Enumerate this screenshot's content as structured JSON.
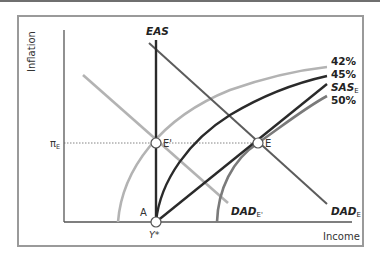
{
  "diagram": {
    "axes": {
      "y_label": "Inflation",
      "x_label": "Income",
      "x_tick": "Y*",
      "y_tick_symbol": "π",
      "y_tick_sub": "E"
    },
    "curves": {
      "eas": "EAS",
      "dad_e_prime": {
        "main": "DAD",
        "sub": "E'"
      },
      "dad_e": {
        "main": "DAD",
        "sub": "E"
      },
      "sas_e": {
        "main": "SAS",
        "sub": "E"
      },
      "pct_42": "42%",
      "pct_45": "45%",
      "pct_50": "50%"
    },
    "points": {
      "a": "A",
      "e_prime": "E'",
      "e": "E"
    },
    "colors": {
      "frame": "#9a9a9a",
      "axis": "#555555",
      "light_gray": "#b3b3b3",
      "mid_gray": "#7a7a7a",
      "dark": "#2a2a2a",
      "dark_gray": "#5c5c5c"
    }
  }
}
